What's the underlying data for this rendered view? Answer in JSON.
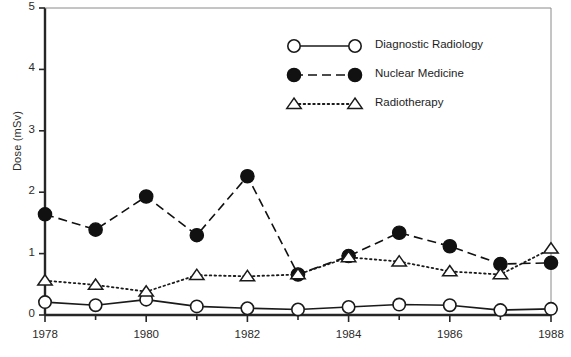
{
  "chart_data": {
    "type": "line",
    "title": "",
    "xlabel": "",
    "ylabel": "Dose (mSv)",
    "xlim": [
      1978,
      1988
    ],
    "ylim": [
      0,
      5
    ],
    "yticks": [
      0,
      1,
      2,
      3,
      4,
      5
    ],
    "xticks_major": [
      1978,
      1980,
      1982,
      1984,
      1986,
      1988
    ],
    "xticks_minor": [
      1979,
      1981,
      1983,
      1985,
      1987
    ],
    "grid": false,
    "legend_position": "top-center",
    "x": [
      1978,
      1979,
      1980,
      1981,
      1982,
      1983,
      1984,
      1985,
      1986,
      1987,
      1988
    ],
    "series": [
      {
        "name": "Diagnostic Radiology",
        "marker": "open-circle",
        "line": "solid",
        "color": "#1a1a1a",
        "values": [
          0.21,
          0.16,
          0.25,
          0.14,
          0.11,
          0.09,
          0.13,
          0.17,
          0.16,
          0.08,
          0.1
        ]
      },
      {
        "name": "Nuclear Medicine",
        "marker": "filled-circle",
        "line": "dashed",
        "color": "#111111",
        "values": [
          1.64,
          1.39,
          1.93,
          1.3,
          2.26,
          0.66,
          0.96,
          1.34,
          1.12,
          0.83,
          0.85
        ]
      },
      {
        "name": "Radiotherapy",
        "marker": "open-triangle",
        "line": "dotted",
        "color": "#1a1a1a",
        "values": [
          0.56,
          0.49,
          0.38,
          0.65,
          0.63,
          0.66,
          0.94,
          0.87,
          0.71,
          0.66,
          1.08
        ]
      }
    ]
  },
  "axis": {
    "y_label": "Dose (mSv)",
    "y_ticks": [
      "0",
      "1",
      "2",
      "3",
      "4",
      "5"
    ],
    "x_ticks": [
      "1978",
      "1980",
      "1982",
      "1984",
      "1986",
      "1988"
    ]
  },
  "legend": {
    "items": [
      {
        "label": "Diagnostic Radiology",
        "marker": "open-circle",
        "line": "solid"
      },
      {
        "label": "Nuclear Medicine",
        "marker": "filled-circle",
        "line": "dashed"
      },
      {
        "label": "Radiotherapy",
        "marker": "open-triangle",
        "line": "dotted"
      }
    ]
  },
  "caption": {
    "partial_text": ""
  }
}
